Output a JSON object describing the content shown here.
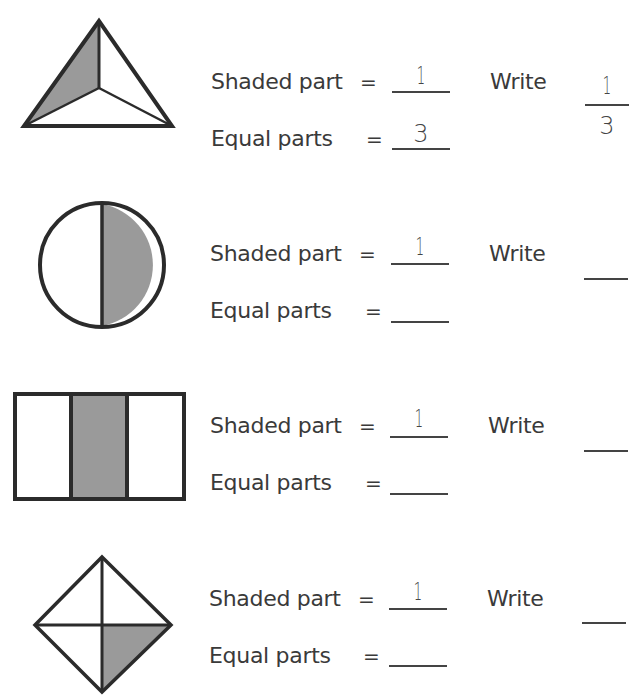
{
  "worksheet": {
    "colors": {
      "shade": "#9a9a9a",
      "stroke": "#2b2b2b",
      "text": "#3a3a3a"
    },
    "labels": {
      "shaded": "Shaded part",
      "equal": "Equal parts",
      "eq_sign": "=",
      "write": "Write"
    },
    "problems": [
      {
        "shape": "triangle-thirds",
        "shaded_answer": "1",
        "equal_answer": "3",
        "fraction_numerator": "1",
        "fraction_denominator": "3"
      },
      {
        "shape": "circle-halves",
        "shaded_answer": "1",
        "equal_answer": "",
        "fraction_numerator": "",
        "fraction_denominator": ""
      },
      {
        "shape": "rectangle-thirds",
        "shaded_answer": "1",
        "equal_answer": "",
        "fraction_numerator": "",
        "fraction_denominator": ""
      },
      {
        "shape": "diamond-quarters",
        "shaded_answer": "1",
        "equal_answer": "",
        "fraction_numerator": "",
        "fraction_denominator": ""
      }
    ]
  }
}
